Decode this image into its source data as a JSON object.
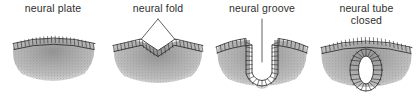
{
  "figure": {
    "background_color": "#ffffff",
    "ink_color": "#2b2b2b",
    "stipple_color": "#9a9a9a",
    "style": "scanned line-art biological diagram, stippled mesenchyme"
  },
  "panels": [
    {
      "id": "neural-plate",
      "label": "neural plate",
      "stage_number": 1,
      "description": "Flat, gently arched thickened neuroepithelial plate of columnar cells overlying stippled mesenchyme.",
      "leader": "none",
      "cell_count": 22
    },
    {
      "id": "neural-fold",
      "label": "neural fold",
      "stage_number": 2,
      "description": "Epithelium buckles; paired neural folds rise on either side of a shallow central depression.",
      "leader": "inverted-v to both fold crests",
      "cell_count": 24
    },
    {
      "id": "neural-groove",
      "label": "neural groove",
      "stage_number": 3,
      "description": "Deep U-shaped invagination forms the neural groove, its walls lined by columnar cells.",
      "leader": "vertical line into groove lumen",
      "cell_count": 30
    },
    {
      "id": "neural-tube-closed",
      "label": "neural tube\nclosed",
      "stage_number": 4,
      "description": "Folds fuse; the neural tube detaches as a closed oval ring of cells beneath continuous surface ectoderm.",
      "leader": "none",
      "cell_count": 20
    }
  ]
}
